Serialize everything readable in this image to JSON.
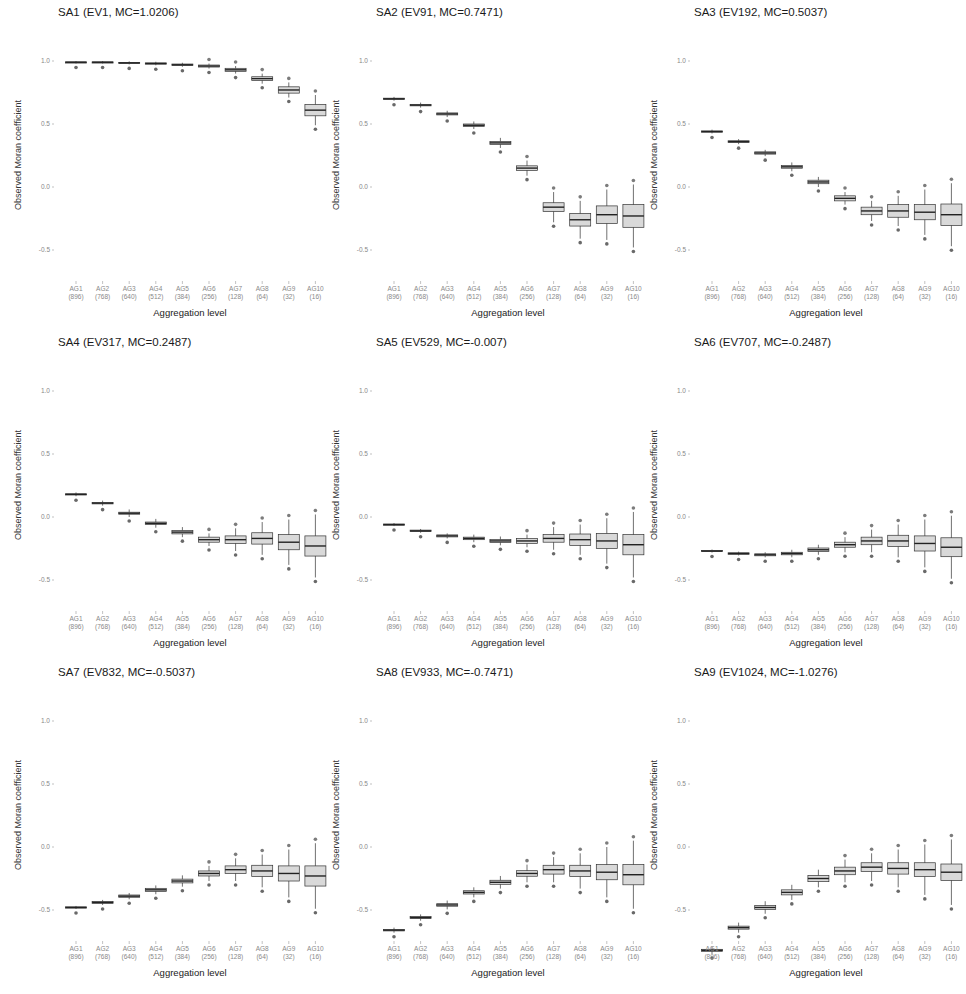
{
  "figure": {
    "y_axis_label": "Observed Moran coefficient",
    "x_axis_label": "Aggregation level",
    "y_ticks": [
      "1.0",
      "0.5",
      "0.0",
      "-0.5"
    ],
    "x_ticks": [
      {
        "label": "AG1",
        "n": "(896)"
      },
      {
        "label": "AG2",
        "n": "(768)"
      },
      {
        "label": "AG3",
        "n": "(640)"
      },
      {
        "label": "AG4",
        "n": "(512)"
      },
      {
        "label": "AG5",
        "n": "(384)"
      },
      {
        "label": "AG6",
        "n": "(256)"
      },
      {
        "label": "AG7",
        "n": "(128)"
      },
      {
        "label": "AG8",
        "n": "(64)"
      },
      {
        "label": "AG9",
        "n": "(32)"
      },
      {
        "label": "AG10",
        "n": "(16)"
      }
    ],
    "colors": {
      "box_fill": "#d9d9d9",
      "box_line": "#333333",
      "outlier": "#444444",
      "background": "#ffffff"
    }
  },
  "chart_data": [
    {
      "type": "box",
      "title": "SA1 (EV1, MC=1.0206)",
      "xlabel": "Aggregation level",
      "ylabel": "Observed Moran coefficient",
      "ylim": [
        -0.75,
        1.05
      ],
      "categories": [
        "AG1 (896)",
        "AG2 (768)",
        "AG3 (640)",
        "AG4 (512)",
        "AG5 (384)",
        "AG6 (256)",
        "AG7 (128)",
        "AG8 (64)",
        "AG9 (32)",
        "AG10 (16)"
      ],
      "medians": [
        0.99,
        0.99,
        0.985,
        0.98,
        0.97,
        0.96,
        0.93,
        0.86,
        0.77,
        0.61
      ],
      "iqr_half": [
        0.003,
        0.003,
        0.004,
        0.005,
        0.006,
        0.008,
        0.012,
        0.015,
        0.025,
        0.045
      ],
      "whisker": [
        0.01,
        0.01,
        0.012,
        0.014,
        0.016,
        0.02,
        0.03,
        0.04,
        0.06,
        0.12
      ]
    },
    {
      "type": "box",
      "title": "SA2 (EV91, MC=0.7471)",
      "xlabel": "Aggregation level",
      "ylabel": "Observed Moran coefficient",
      "ylim": [
        -0.75,
        1.05
      ],
      "categories": [
        "AG1 (896)",
        "AG2 (768)",
        "AG3 (640)",
        "AG4 (512)",
        "AG5 (384)",
        "AG6 (256)",
        "AG7 (128)",
        "AG8 (64)",
        "AG9 (32)",
        "AG10 (16)"
      ],
      "medians": [
        0.7,
        0.65,
        0.58,
        0.49,
        0.35,
        0.15,
        -0.16,
        -0.26,
        -0.22,
        -0.23
      ],
      "iqr_half": [
        0.005,
        0.006,
        0.008,
        0.01,
        0.012,
        0.018,
        0.035,
        0.05,
        0.07,
        0.09
      ],
      "whisker": [
        0.015,
        0.02,
        0.025,
        0.03,
        0.04,
        0.06,
        0.12,
        0.15,
        0.2,
        0.25
      ]
    },
    {
      "type": "box",
      "title": "SA3 (EV192, MC=0.5037)",
      "xlabel": "Aggregation level",
      "ylabel": "Observed Moran coefficient",
      "ylim": [
        -0.75,
        1.05
      ],
      "categories": [
        "AG1 (896)",
        "AG2 (768)",
        "AG3 (640)",
        "AG4 (512)",
        "AG5 (384)",
        "AG6 (256)",
        "AG7 (128)",
        "AG8 (64)",
        "AG9 (32)",
        "AG10 (16)"
      ],
      "medians": [
        0.44,
        0.36,
        0.27,
        0.16,
        0.04,
        -0.09,
        -0.19,
        -0.19,
        -0.2,
        -0.22
      ],
      "iqr_half": [
        0.005,
        0.007,
        0.009,
        0.011,
        0.014,
        0.02,
        0.03,
        0.05,
        0.06,
        0.085
      ],
      "whisker": [
        0.015,
        0.02,
        0.025,
        0.035,
        0.04,
        0.05,
        0.08,
        0.12,
        0.18,
        0.25
      ]
    },
    {
      "type": "box",
      "title": "SA4 (EV317, MC=0.2487)",
      "xlabel": "Aggregation level",
      "ylabel": "Observed Moran coefficient",
      "ylim": [
        -0.75,
        1.05
      ],
      "categories": [
        "AG1 (896)",
        "AG2 (768)",
        "AG3 (640)",
        "AG4 (512)",
        "AG5 (384)",
        "AG6 (256)",
        "AG7 (128)",
        "AG8 (64)",
        "AG9 (32)",
        "AG10 (16)"
      ],
      "medians": [
        0.18,
        0.11,
        0.03,
        -0.05,
        -0.12,
        -0.18,
        -0.18,
        -0.17,
        -0.2,
        -0.23
      ],
      "iqr_half": [
        0.004,
        0.006,
        0.008,
        0.01,
        0.014,
        0.02,
        0.03,
        0.045,
        0.06,
        0.08
      ],
      "whisker": [
        0.015,
        0.02,
        0.03,
        0.035,
        0.04,
        0.05,
        0.09,
        0.13,
        0.18,
        0.25
      ]
    },
    {
      "type": "box",
      "title": "SA5 (EV529, MC=-0.007)",
      "xlabel": "Aggregation level",
      "ylabel": "Observed Moran coefficient",
      "ylim": [
        -0.75,
        1.05
      ],
      "categories": [
        "AG1 (896)",
        "AG2 (768)",
        "AG3 (640)",
        "AG4 (512)",
        "AG5 (384)",
        "AG6 (256)",
        "AG7 (128)",
        "AG8 (64)",
        "AG9 (32)",
        "AG10 (16)"
      ],
      "medians": [
        -0.06,
        -0.11,
        -0.15,
        -0.17,
        -0.19,
        -0.19,
        -0.17,
        -0.18,
        -0.19,
        -0.22
      ],
      "iqr_half": [
        0.004,
        0.006,
        0.008,
        0.01,
        0.012,
        0.02,
        0.03,
        0.045,
        0.06,
        0.08
      ],
      "whisker": [
        0.012,
        0.015,
        0.02,
        0.03,
        0.035,
        0.05,
        0.09,
        0.12,
        0.18,
        0.26
      ]
    },
    {
      "type": "box",
      "title": "SA6 (EV707, MC=-0.2487)",
      "xlabel": "Aggregation level",
      "ylabel": "Observed Moran coefficient",
      "ylim": [
        -0.75,
        1.05
      ],
      "categories": [
        "AG1 (896)",
        "AG2 (768)",
        "AG3 (640)",
        "AG4 (512)",
        "AG5 (384)",
        "AG6 (256)",
        "AG7 (128)",
        "AG8 (64)",
        "AG9 (32)",
        "AG10 (16)"
      ],
      "medians": [
        -0.27,
        -0.29,
        -0.3,
        -0.29,
        -0.26,
        -0.22,
        -0.19,
        -0.19,
        -0.21,
        -0.24
      ],
      "iqr_half": [
        0.005,
        0.006,
        0.008,
        0.01,
        0.014,
        0.02,
        0.03,
        0.045,
        0.06,
        0.075
      ],
      "whisker": [
        0.012,
        0.015,
        0.02,
        0.03,
        0.04,
        0.06,
        0.09,
        0.13,
        0.19,
        0.25
      ]
    },
    {
      "type": "box",
      "title": "SA7 (EV832, MC=-0.5037)",
      "xlabel": "Aggregation level",
      "ylabel": "Observed Moran coefficient",
      "ylim": [
        -0.75,
        1.05
      ],
      "categories": [
        "AG1 (896)",
        "AG2 (768)",
        "AG3 (640)",
        "AG4 (512)",
        "AG5 (384)",
        "AG6 (256)",
        "AG7 (128)",
        "AG8 (64)",
        "AG9 (32)",
        "AG10 (16)"
      ],
      "medians": [
        -0.48,
        -0.44,
        -0.39,
        -0.34,
        -0.27,
        -0.21,
        -0.18,
        -0.19,
        -0.21,
        -0.23
      ],
      "iqr_half": [
        0.005,
        0.007,
        0.009,
        0.012,
        0.015,
        0.02,
        0.03,
        0.045,
        0.06,
        0.08
      ],
      "whisker": [
        0.012,
        0.02,
        0.025,
        0.035,
        0.045,
        0.06,
        0.09,
        0.13,
        0.19,
        0.26
      ]
    },
    {
      "type": "box",
      "title": "SA8 (EV933, MC=-0.7471)",
      "xlabel": "Aggregation level",
      "ylabel": "Observed Moran coefficient",
      "ylim": [
        -0.75,
        1.05
      ],
      "categories": [
        "AG1 (896)",
        "AG2 (768)",
        "AG3 (640)",
        "AG4 (512)",
        "AG5 (384)",
        "AG6 (256)",
        "AG7 (128)",
        "AG8 (64)",
        "AG9 (32)",
        "AG10 (16)"
      ],
      "medians": [
        -0.66,
        -0.56,
        -0.46,
        -0.36,
        -0.28,
        -0.21,
        -0.18,
        -0.19,
        -0.2,
        -0.22
      ],
      "iqr_half": [
        0.006,
        0.008,
        0.01,
        0.013,
        0.016,
        0.022,
        0.035,
        0.045,
        0.06,
        0.08
      ],
      "whisker": [
        0.02,
        0.025,
        0.035,
        0.04,
        0.05,
        0.07,
        0.1,
        0.14,
        0.2,
        0.27
      ]
    },
    {
      "type": "box",
      "title": "SA9 (EV1024, MC=-1.0276)",
      "xlabel": "Aggregation level",
      "ylabel": "Observed Moran coefficient",
      "ylim": [
        -0.9,
        1.05
      ],
      "categories": [
        "AG1 (896)",
        "AG2 (768)",
        "AG3 (640)",
        "AG4 (512)",
        "AG5 (384)",
        "AG6 (256)",
        "AG7 (128)",
        "AG8 (64)",
        "AG9 (32)",
        "AG10 (16)"
      ],
      "medians": [
        -0.82,
        -0.64,
        -0.48,
        -0.36,
        -0.25,
        -0.19,
        -0.16,
        -0.17,
        -0.18,
        -0.2
      ],
      "iqr_half": [
        0.008,
        0.012,
        0.015,
        0.02,
        0.025,
        0.03,
        0.035,
        0.045,
        0.055,
        0.065
      ],
      "whisker": [
        0.03,
        0.04,
        0.05,
        0.06,
        0.07,
        0.09,
        0.11,
        0.15,
        0.2,
        0.26
      ]
    }
  ]
}
